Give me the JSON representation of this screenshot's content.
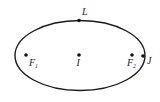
{
  "diagram": {
    "type": "ellipse",
    "center": [
      80,
      55
    ],
    "rx": 65,
    "ry": 35,
    "stroke": "#1a1a1a",
    "points": [
      {
        "id": "L",
        "label": "L",
        "sub": "",
        "x": 79,
        "y": 20
      },
      {
        "id": "F1",
        "label": "F",
        "sub": "1",
        "x": 26,
        "y": 55
      },
      {
        "id": "I",
        "label": "I",
        "sub": "",
        "x": 79,
        "y": 55
      },
      {
        "id": "F2",
        "label": "F",
        "sub": "2",
        "x": 132,
        "y": 55
      },
      {
        "id": "J",
        "label": "J",
        "sub": "",
        "x": 144,
        "y": 56
      }
    ]
  }
}
